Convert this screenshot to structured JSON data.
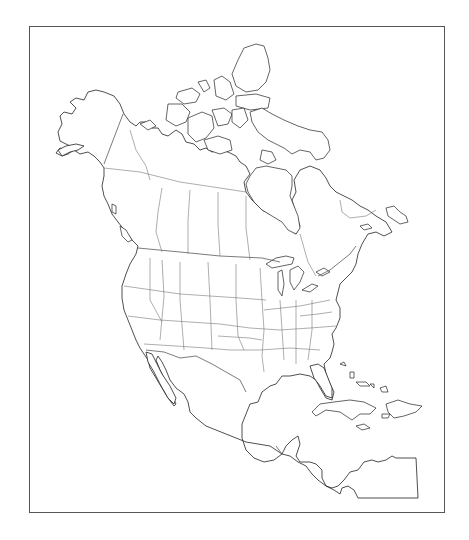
{
  "map": {
    "type": "blank outline map",
    "region": "North America",
    "frame": {
      "x": 29,
      "y": 26,
      "width": 416,
      "height": 487,
      "stroke": "#555555"
    },
    "colors": {
      "background": "#ffffff",
      "coastline": "#222222",
      "internal_borders": "#777777"
    },
    "features": [
      "Alaska",
      "Canada provinces and territories",
      "Canadian Arctic Archipelago",
      "Hudson Bay",
      "Contiguous United States with state borders",
      "Great Lakes",
      "Mexico",
      "Baja California",
      "Gulf of Mexico",
      "Florida",
      "Caribbean islands (Cuba, Hispaniola, Jamaica, Bahamas)",
      "Central America",
      "Panama"
    ],
    "labels": []
  }
}
